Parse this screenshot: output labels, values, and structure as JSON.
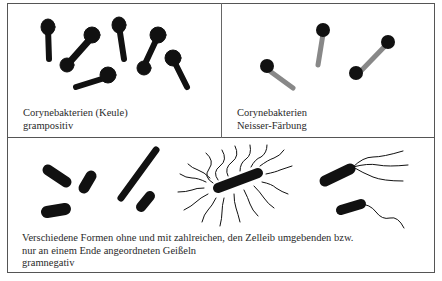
{
  "figure": {
    "panels": [
      {
        "id": "corynebacteria-gram-positive",
        "caption_lines": [
          "Corynebakterien (Keule)",
          "grampositiv"
        ],
        "stain_color": "#111111"
      },
      {
        "id": "corynebacteria-neisser",
        "caption_lines": [
          "Corynebakterien",
          "Neisser-Färbung"
        ],
        "body_color": "#888888",
        "granule_color": "#111111"
      },
      {
        "id": "gram-negative-forms",
        "caption_lines": [
          "Verschiedene Formen ohne und mit zahlreichen, den Zelleib umgebenden bzw.",
          "nur an einem Ende angeordneten Geißeln",
          "gramnegativ"
        ],
        "stain_color": "#111111"
      }
    ]
  }
}
